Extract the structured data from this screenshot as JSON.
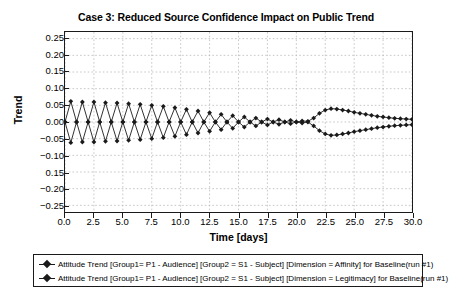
{
  "chart_data": {
    "type": "line",
    "title": "Case 3: Reduced Source Confidence Impact on Public Trend",
    "xlabel": "Time [days]",
    "ylabel": "Trend",
    "xlim": [
      0.0,
      30.0
    ],
    "ylim": [
      -0.27,
      0.27
    ],
    "grid": true,
    "grid_style": "dotted",
    "legend_position": "below-plot",
    "xticks": [
      "0.0",
      "2.5",
      "5.0",
      "7.5",
      "10.0",
      "12.5",
      "15.0",
      "17.5",
      "20.0",
      "22.5",
      "25.0",
      "27.5",
      "30.0"
    ],
    "xtick_values": [
      0.0,
      2.5,
      5.0,
      7.5,
      10.0,
      12.5,
      15.0,
      17.5,
      20.0,
      22.5,
      25.0,
      27.5,
      30.0
    ],
    "yticks": [
      "0.25",
      "0.20",
      "0.15",
      "0.10",
      "0.05",
      "0.00",
      "−0.05",
      "−0.10",
      "0.15",
      "−0.20",
      "−0.25"
    ],
    "ytick_values": [
      0.25,
      0.2,
      0.15,
      0.1,
      0.05,
      0.0,
      -0.05,
      -0.1,
      -0.15,
      -0.2,
      -0.25
    ],
    "marker": "diamond",
    "series": [
      {
        "name": "Attitude Trend [Group1= P1 - Audience] [Group2 = S1 - Subject] [Dimension = Affinity] for Baseline(run #1)",
        "color": "#1a1a1a",
        "x": [
          0.0,
          0.5,
          1.0,
          1.5,
          2.0,
          2.5,
          3.0,
          3.5,
          4.0,
          4.5,
          5.0,
          5.5,
          6.0,
          6.5,
          7.0,
          7.5,
          8.0,
          8.5,
          9.0,
          9.5,
          10.0,
          10.5,
          11.0,
          11.5,
          12.0,
          12.5,
          13.0,
          13.5,
          14.0,
          14.5,
          15.0,
          15.5,
          16.0,
          16.5,
          17.0,
          17.5,
          18.0,
          18.5,
          19.0,
          19.5,
          20.0,
          20.5,
          21.0,
          21.5,
          22.0,
          22.5,
          23.0,
          23.5,
          24.0,
          24.5,
          25.0,
          25.5,
          26.0,
          26.5,
          27.0,
          27.5,
          28.0,
          28.5,
          29.0,
          29.5,
          30.0
        ],
        "values": [
          0.0,
          0.062,
          0.0,
          -0.06,
          0.0,
          0.06,
          0.0,
          -0.058,
          0.0,
          0.057,
          0.0,
          -0.055,
          0.0,
          0.053,
          0.0,
          -0.05,
          0.0,
          0.047,
          0.0,
          -0.043,
          0.0,
          0.038,
          0.0,
          -0.033,
          0.0,
          0.028,
          0.0,
          -0.023,
          0.0,
          0.019,
          0.0,
          -0.015,
          0.0,
          0.012,
          0.0,
          -0.009,
          0.0,
          0.007,
          0.0,
          -0.005,
          0.0,
          0.003,
          0.002,
          0.012,
          0.026,
          0.036,
          0.04,
          0.039,
          0.036,
          0.033,
          0.029,
          0.026,
          0.023,
          0.02,
          0.017,
          0.015,
          0.013,
          0.011,
          0.01,
          0.009,
          0.008
        ]
      },
      {
        "name": "Attitude Trend [Group1= P1 - Audience] [Group2 = S1 - Subject] [Dimension = Legitimacy] for Baseline(run #1)",
        "color": "#1a1a1a",
        "x": [
          0.0,
          0.5,
          1.0,
          1.5,
          2.0,
          2.5,
          3.0,
          3.5,
          4.0,
          4.5,
          5.0,
          5.5,
          6.0,
          6.5,
          7.0,
          7.5,
          8.0,
          8.5,
          9.0,
          9.5,
          10.0,
          10.5,
          11.0,
          11.5,
          12.0,
          12.5,
          13.0,
          13.5,
          14.0,
          14.5,
          15.0,
          15.5,
          16.0,
          16.5,
          17.0,
          17.5,
          18.0,
          18.5,
          19.0,
          19.5,
          20.0,
          20.5,
          21.0,
          21.5,
          22.0,
          22.5,
          23.0,
          23.5,
          24.0,
          24.5,
          25.0,
          25.5,
          26.0,
          26.5,
          27.0,
          27.5,
          28.0,
          28.5,
          29.0,
          29.5,
          30.0
        ],
        "values": [
          0.0,
          -0.062,
          0.0,
          0.06,
          0.0,
          -0.06,
          0.0,
          0.058,
          0.0,
          -0.057,
          0.0,
          0.055,
          0.0,
          -0.053,
          0.0,
          0.05,
          0.0,
          -0.047,
          0.0,
          0.043,
          0.0,
          -0.038,
          0.0,
          0.033,
          0.0,
          -0.028,
          0.0,
          0.023,
          0.0,
          -0.019,
          0.0,
          0.015,
          0.0,
          -0.012,
          0.0,
          0.009,
          0.0,
          -0.007,
          0.0,
          0.005,
          0.0,
          -0.003,
          0.0,
          -0.012,
          -0.026,
          -0.036,
          -0.04,
          -0.039,
          -0.036,
          -0.033,
          -0.029,
          -0.026,
          -0.023,
          -0.02,
          -0.017,
          -0.015,
          -0.013,
          -0.011,
          -0.01,
          -0.009,
          -0.008
        ]
      }
    ]
  }
}
